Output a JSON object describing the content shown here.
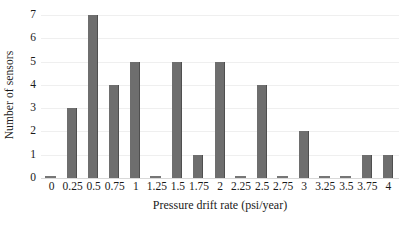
{
  "chart_data": {
    "type": "bar",
    "title": "",
    "xlabel": "Pressure drift rate (psi/year)",
    "ylabel": "Number of sensors",
    "categories": [
      "0",
      "0.25",
      "0.5",
      "0.75",
      "1",
      "1.25",
      "1.5",
      "1.75",
      "2",
      "2.25",
      "2.5",
      "2.75",
      "3",
      "3.25",
      "3.5",
      "3.75",
      "4"
    ],
    "values": [
      0,
      3,
      7,
      4,
      5,
      0,
      5,
      1,
      5,
      0,
      4,
      0,
      2,
      0,
      0,
      1,
      1
    ],
    "ylim": [
      0,
      7
    ],
    "yticks": [
      0,
      1,
      2,
      3,
      4,
      5,
      6,
      7
    ],
    "grid": true,
    "legend": null,
    "bar_color": "#6e6e6e",
    "gridline_color": "#efefef",
    "axis_color": "#d9d9d9",
    "background_color": "#ffffff"
  }
}
